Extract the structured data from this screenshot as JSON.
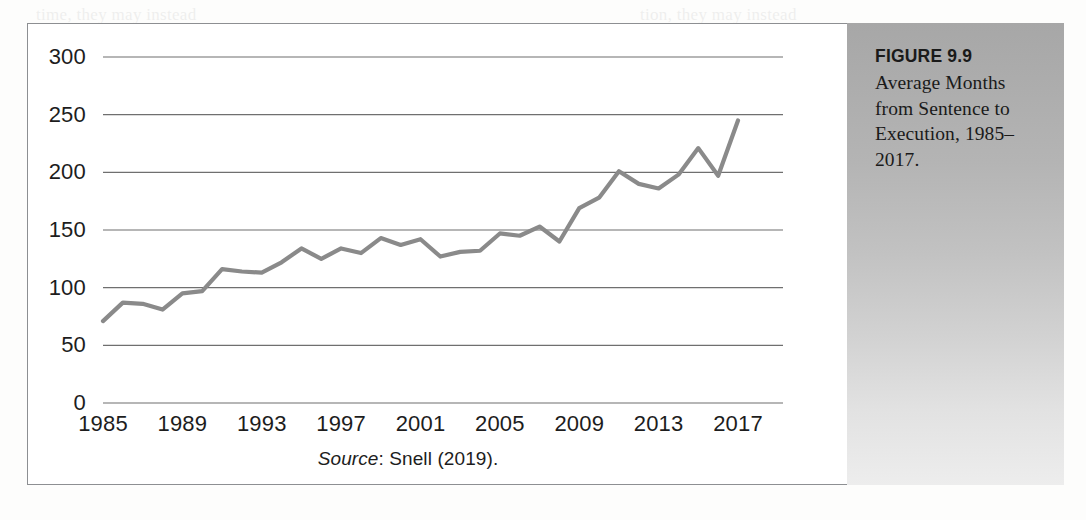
{
  "figure": {
    "number_label": "FIGURE 9.9",
    "title": "Average Months from Sentence to Execution, 1985–2017.",
    "source_label": "Source",
    "source_rest": ": Snell (2019)."
  },
  "colors": {
    "line": "#8a8a8a",
    "gridline": "#6f6f6f",
    "frame_border": "#8d8f92",
    "caption_panel_top": "#a7a7a7",
    "caption_panel_bottom": "#ededed",
    "text": "#1d1d1d"
  },
  "chart_data": {
    "type": "line",
    "title": "Average Months from Sentence to Execution, 1985–2017",
    "xlabel": "",
    "ylabel": "",
    "xlim": [
      1985,
      2017
    ],
    "ylim": [
      0,
      300
    ],
    "grid": true,
    "legend": false,
    "y_ticks": [
      0,
      50,
      100,
      150,
      200,
      250,
      300
    ],
    "y_tick_labels": [
      "0",
      "50",
      "100",
      "150",
      "200",
      "250",
      "300"
    ],
    "x_ticks": [
      1985,
      1989,
      1993,
      1997,
      2001,
      2005,
      2009,
      2013,
      2017
    ],
    "x_tick_labels": [
      "1985",
      "1989",
      "1993",
      "1997",
      "2001",
      "2005",
      "2009",
      "2013",
      "2017"
    ],
    "series": [
      {
        "name": "Average months from sentence to execution",
        "x": [
          1985,
          1986,
          1987,
          1988,
          1989,
          1990,
          1991,
          1992,
          1993,
          1994,
          1995,
          1996,
          1997,
          1998,
          1999,
          2000,
          2001,
          2002,
          2003,
          2004,
          2005,
          2006,
          2007,
          2008,
          2009,
          2010,
          2011,
          2012,
          2013,
          2014,
          2015,
          2016,
          2017
        ],
        "values": [
          71,
          87,
          86,
          81,
          95,
          97,
          116,
          114,
          113,
          122,
          134,
          125,
          134,
          130,
          143,
          137,
          142,
          127,
          131,
          132,
          147,
          145,
          153,
          140,
          169,
          178,
          201,
          190,
          186,
          198,
          221,
          197,
          245
        ]
      }
    ]
  }
}
